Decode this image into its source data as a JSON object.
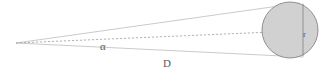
{
  "figure": {
    "background_color": "#ffffff",
    "labels": {
      "angle": "α",
      "distance": "D",
      "radius": "r"
    },
    "colors": {
      "circle_fill": "#cfcfcf",
      "circle_stroke": "#8f8f8f",
      "tangent_line": "#b9b9b9",
      "axis_dashed_line": "#9e9e9e",
      "diameter_line": "#8a8a8a",
      "text": "#5a5a5a"
    },
    "geometry": {
      "apex": {
        "x": 16,
        "y": 43
      },
      "circle": {
        "cx": 290,
        "cy": 30,
        "r": 28
      },
      "diameter_line": {
        "x": 303,
        "y1": 2,
        "y2": 58
      },
      "tangent_upper_end": {
        "x": 300,
        "y": 3
      },
      "tangent_lower_end": {
        "x": 303,
        "y": 57
      },
      "axis_end": {
        "x": 318,
        "y": 30
      }
    }
  }
}
